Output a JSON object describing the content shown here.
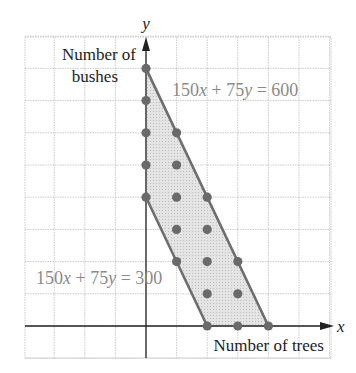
{
  "chart_data": {
    "type": "scatter",
    "title": "",
    "xlabel": "Number of trees",
    "ylabel": "Number of bushes",
    "x_axis_symbol": "x",
    "y_axis_symbol": "y",
    "xlim": [
      -4,
      6
    ],
    "ylim": [
      -1,
      9
    ],
    "grid": true,
    "boundary_lines": [
      {
        "label": "150x + 75y = 600",
        "points": [
          [
            0,
            8
          ],
          [
            4,
            0
          ]
        ]
      },
      {
        "label": "150x + 75y = 300",
        "points": [
          [
            0,
            4
          ],
          [
            2,
            0
          ]
        ]
      }
    ],
    "shaded_region": [
      [
        0,
        4
      ],
      [
        0,
        8
      ],
      [
        4,
        0
      ],
      [
        2,
        0
      ]
    ],
    "points": [
      [
        0,
        4
      ],
      [
        0,
        5
      ],
      [
        0,
        6
      ],
      [
        0,
        7
      ],
      [
        0,
        8
      ],
      [
        1,
        2
      ],
      [
        1,
        3
      ],
      [
        1,
        4
      ],
      [
        1,
        5
      ],
      [
        1,
        6
      ],
      [
        2,
        0
      ],
      [
        2,
        1
      ],
      [
        2,
        2
      ],
      [
        2,
        3
      ],
      [
        2,
        4
      ],
      [
        3,
        0
      ],
      [
        3,
        1
      ],
      [
        3,
        2
      ],
      [
        4,
        0
      ]
    ]
  },
  "labels": {
    "y_symbol": "y",
    "x_symbol": "x",
    "ylabel_line1": "Number of",
    "ylabel_line2": "bushes",
    "xlabel": "Number of trees",
    "eq_upper": "150x + 75y = 600",
    "eq_lower": "150x + 75y = 300"
  },
  "colors": {
    "grid": "#bdbdbd",
    "axis": "#222222",
    "boundary": "#6e6e6e",
    "fill": "#d9d9d9",
    "point": "#6a6a6a",
    "eq_text": "#8a8a8a"
  }
}
